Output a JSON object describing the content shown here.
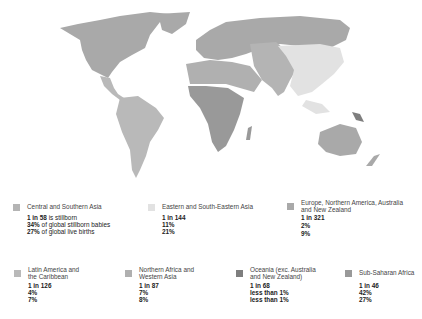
{
  "colors": {
    "background": "#ffffff",
    "central_southern_asia": "#b4b4b4",
    "eastern_southeastern_asia": "#e2e2e2",
    "europe_na_aus_nz": "#a9a9a9",
    "latin_america_caribbean": "#b9b9b9",
    "northern_africa_western_asia": "#b0b0b0",
    "oceania": "#7e7e7e",
    "sub_saharan_africa": "#999999"
  },
  "legend": [
    {
      "region": "Central and Southern Asia",
      "stillbirth_rate": "1 in 58",
      "stillbirth_rate_suffix": " is stillborn",
      "share_stillborn": "34%",
      "share_stillborn_suffix": " of global stillborn babies",
      "share_live_births": "27%",
      "share_live_births_suffix": " of global live births"
    },
    {
      "region": "Eastern and South-Eastern Asia",
      "stillbirth_rate": "1 in 144",
      "share_stillborn": "11%",
      "share_live_births": "21%"
    },
    {
      "region_line1": "Europe, Northern America, Australia",
      "region_line2": "and New Zealand",
      "stillbirth_rate": "1 in 321",
      "share_stillborn": "2%",
      "share_live_births": "9%"
    },
    {
      "region_line1": "Latin America and",
      "region_line2": "the Caribbean",
      "stillbirth_rate": "1 in 126",
      "share_stillborn": "4%",
      "share_live_births": "7%"
    },
    {
      "region_line1": "Northern Africa and",
      "region_line2": "Western Asia",
      "stillbirth_rate": "1 in 87",
      "share_stillborn": "7%",
      "share_live_births": "8%"
    },
    {
      "region_line1": "Oceania (exc. Australia",
      "region_line2": "and New Zealand)",
      "stillbirth_rate": "1 in 68",
      "share_stillborn": "less than 1%",
      "share_live_births": "less than 1%"
    },
    {
      "region": "Sub-Saharan Africa",
      "stillbirth_rate": "1 in 46",
      "share_stillborn": "42%",
      "share_live_births": "27%"
    }
  ]
}
